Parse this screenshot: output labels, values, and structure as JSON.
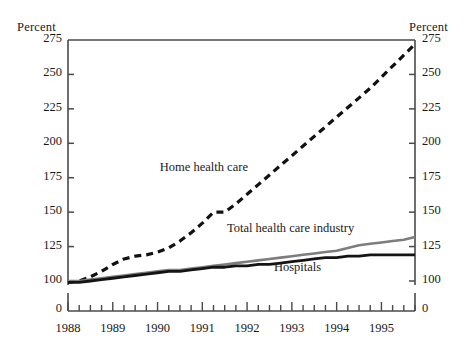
{
  "chart_data": {
    "type": "line",
    "title": "",
    "xlabel": "",
    "ylabel": "Percent",
    "ylabel_right": "Percent",
    "ylim": [
      95,
      275
    ],
    "yticks": [
      100,
      125,
      150,
      175,
      200,
      225,
      250,
      275
    ],
    "ytick_labels": [
      "100",
      "125",
      "150",
      "175",
      "200",
      "225",
      "250",
      "275"
    ],
    "axis_break_label": "0",
    "xlim": [
      1988.0,
      1995.75
    ],
    "xticks": [
      1988,
      1989,
      1990,
      1991,
      1992,
      1993,
      1994,
      1995
    ],
    "xtick_labels": [
      "1988",
      "1989",
      "1990",
      "1991",
      "1992",
      "1993",
      "1994",
      "1995"
    ],
    "minor_xticks_per_year": 4,
    "grid": false,
    "legend_position": "inline-annotations",
    "x": [
      1988.0,
      1988.25,
      1988.5,
      1988.75,
      1989.0,
      1989.25,
      1989.5,
      1989.75,
      1990.0,
      1990.25,
      1990.5,
      1990.75,
      1991.0,
      1991.25,
      1991.5,
      1991.75,
      1992.0,
      1992.25,
      1992.5,
      1992.75,
      1993.0,
      1993.25,
      1993.5,
      1993.75,
      1994.0,
      1994.25,
      1994.5,
      1994.75,
      1995.0,
      1995.25,
      1995.5,
      1995.75
    ],
    "series": [
      {
        "name": "Home health care",
        "style": "dashed",
        "color": "#111111",
        "width": 3.2,
        "label_x": 1990.05,
        "label_y": 181,
        "values": [
          99,
          100,
          103,
          107,
          112,
          116,
          118,
          119,
          121,
          124,
          129,
          135,
          142,
          150,
          150,
          156,
          163,
          170,
          177,
          184,
          191,
          198,
          205,
          212,
          219,
          226,
          233,
          240,
          248,
          256,
          264,
          272
        ]
      },
      {
        "name": "Total health care industry",
        "style": "solid",
        "color": "#7d7d7d",
        "width": 2.6,
        "label_x": 1991.55,
        "label_y": 137,
        "values": [
          100,
          100,
          101,
          102,
          103,
          104,
          105,
          106,
          107,
          108,
          108,
          109,
          110,
          111,
          112,
          113,
          114,
          115,
          116,
          117,
          118,
          119,
          120,
          121,
          122,
          124,
          126,
          127,
          128,
          129,
          130,
          132
        ]
      },
      {
        "name": "Hospitals",
        "style": "solid",
        "color": "#141414",
        "width": 2.8,
        "label_x": 1992.6,
        "label_y": 109,
        "values": [
          99,
          99,
          100,
          101,
          102,
          103,
          104,
          105,
          106,
          107,
          107,
          108,
          109,
          110,
          110,
          111,
          111,
          112,
          112,
          113,
          114,
          115,
          116,
          117,
          117,
          118,
          118,
          119,
          119,
          119,
          119,
          119
        ]
      }
    ]
  }
}
